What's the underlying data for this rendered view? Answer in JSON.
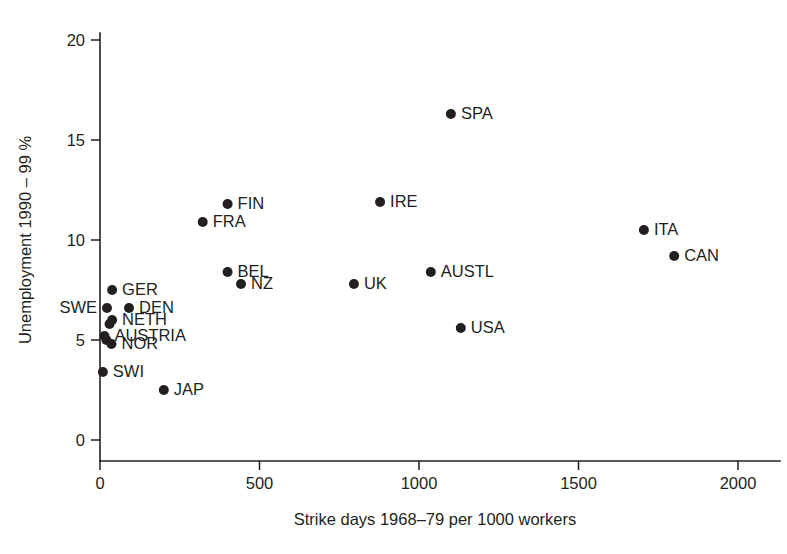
{
  "chart_data": {
    "type": "scatter",
    "title": "",
    "xlabel": "Strike days 1968–79 per 1000 workers",
    "ylabel": "Unemployment 1990 – 99 %",
    "xlim": [
      0,
      2000
    ],
    "ylim": [
      0,
      20
    ],
    "xticks": [
      0,
      500,
      1000,
      1500,
      2000
    ],
    "xtick_labels": [
      "0",
      "500",
      "1000",
      "1500",
      "2000"
    ],
    "yticks": [
      0,
      5,
      10,
      15,
      20
    ],
    "ytick_labels": [
      "0",
      "5",
      "10",
      "15",
      "20"
    ],
    "grid": false,
    "legend": "none",
    "marker_color": "#231f20",
    "points": [
      {
        "label": "SPA",
        "x": 1100,
        "y": 16.3,
        "label_pos": "right"
      },
      {
        "label": "IRE",
        "x": 878,
        "y": 11.9,
        "label_pos": "right"
      },
      {
        "label": "FIN",
        "x": 400,
        "y": 11.8,
        "label_pos": "right"
      },
      {
        "label": "FRA",
        "x": 322,
        "y": 10.9,
        "label_pos": "right"
      },
      {
        "label": "ITA",
        "x": 1705,
        "y": 10.5,
        "label_pos": "right"
      },
      {
        "label": "CAN",
        "x": 1800,
        "y": 9.2,
        "label_pos": "right"
      },
      {
        "label": "BEL",
        "x": 400,
        "y": 8.4,
        "label_pos": "right"
      },
      {
        "label": "AUSTL",
        "x": 1037,
        "y": 8.4,
        "label_pos": "right"
      },
      {
        "label": "NZ",
        "x": 442,
        "y": 7.8,
        "label_pos": "right"
      },
      {
        "label": "UK",
        "x": 796,
        "y": 7.8,
        "label_pos": "right"
      },
      {
        "label": "GER",
        "x": 38,
        "y": 7.5,
        "label_pos": "right"
      },
      {
        "label": "DEN",
        "x": 91,
        "y": 6.6,
        "label_pos": "right"
      },
      {
        "label": "SWE",
        "x": 22,
        "y": 6.6,
        "label_pos": "left"
      },
      {
        "label": "NETH",
        "x": 38,
        "y": 6.0,
        "label_pos": "right"
      },
      {
        "label": "USA",
        "x": 1131,
        "y": 5.6,
        "label_pos": "right"
      },
      {
        "label": "AUSTRIA",
        "x": 14,
        "y": 5.2,
        "label_pos": "right"
      },
      {
        "label": "NOR",
        "x": 36,
        "y": 4.8,
        "label_pos": "right"
      },
      {
        "label": "SWI",
        "x": 9,
        "y": 3.4,
        "label_pos": "right"
      },
      {
        "label": "JAP",
        "x": 200,
        "y": 2.5,
        "label_pos": "right"
      }
    ],
    "extra_markers": [
      {
        "x": 30,
        "y": 5.8
      },
      {
        "x": 20,
        "y": 5.0
      }
    ]
  }
}
